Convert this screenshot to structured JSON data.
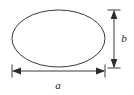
{
  "figure": {
    "type": "geometry-diagram",
    "background_color": "#ffffff",
    "stroke_color": "#3a3a3a",
    "label_color": "#1a1a1a",
    "shape": {
      "name": "ellipse",
      "center_x": 58.5,
      "center_y": 38.5,
      "radius_x": 46.5,
      "radius_y": 28.5,
      "fill": "none",
      "stroke_width": 1
    },
    "dimensions": [
      {
        "id": "width-dimension",
        "label": "a",
        "orientation": "horizontal",
        "meaning": "ellipse width (major axis)",
        "line_y": 71,
        "from_x": 12,
        "to_x": 105,
        "label_x": 58,
        "label_y": 89,
        "arrowheads": "both",
        "extension_ticks": true
      },
      {
        "id": "height-dimension",
        "label": "b",
        "orientation": "vertical",
        "meaning": "ellipse height (minor axis)",
        "line_x": 114,
        "from_y": 10,
        "to_y": 68,
        "label_x": 124,
        "label_y": 42,
        "arrowheads": "both",
        "extension_ticks": true
      }
    ]
  }
}
